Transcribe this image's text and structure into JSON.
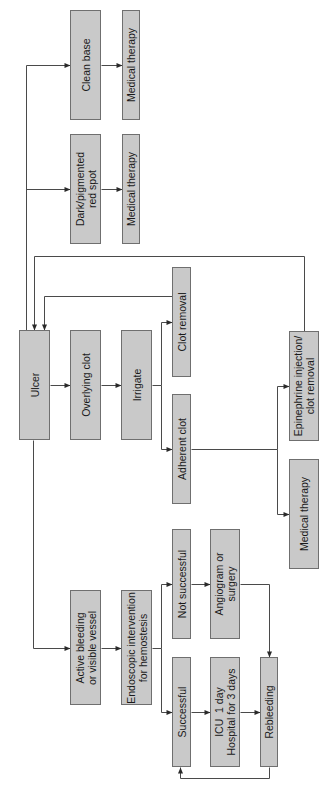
{
  "diagram": {
    "orientation": "rotated-90-ccw",
    "colors": {
      "box_fill": "#c9c9c9",
      "box_border": "#6f6f6f",
      "line": "#4a4a4a",
      "background": "#ffffff"
    },
    "nodes": [
      {
        "id": "clean_base",
        "label": "Clean base",
        "x": 70,
        "y": 10,
        "w": 31,
        "h": 110
      },
      {
        "id": "med_therapy_1",
        "label": "Medical therapy",
        "x": 122,
        "y": 10,
        "w": 18,
        "h": 110
      },
      {
        "id": "dark_spot",
        "label": "Dark/pigmented\nred spot",
        "x": 70,
        "y": 134,
        "w": 31,
        "h": 110
      },
      {
        "id": "med_therapy_2",
        "label": "Medical therapy",
        "x": 122,
        "y": 134,
        "w": 18,
        "h": 110
      },
      {
        "id": "ulcer",
        "label": "Ulcer",
        "x": 19,
        "y": 330,
        "w": 31,
        "h": 110
      },
      {
        "id": "overlying_clot",
        "label": "Overlying clot",
        "x": 70,
        "y": 330,
        "w": 31,
        "h": 110
      },
      {
        "id": "irrigate",
        "label": "Irrigate",
        "x": 121,
        "y": 330,
        "w": 31,
        "h": 110
      },
      {
        "id": "clot_removal",
        "label": "Clot removal",
        "x": 172,
        "y": 267,
        "w": 19,
        "h": 110
      },
      {
        "id": "adherent_clot",
        "label": "Adherent clot",
        "x": 172,
        "y": 394,
        "w": 19,
        "h": 110
      },
      {
        "id": "epinephrine",
        "label": "Epinephrine injection/\nclot removal",
        "x": 289,
        "y": 331,
        "w": 30,
        "h": 110
      },
      {
        "id": "med_therapy_3",
        "label": "Medical therapy",
        "x": 289,
        "y": 459,
        "w": 30,
        "h": 110
      },
      {
        "id": "active_bleeding",
        "label": "Active bleeding\nor visible vessel",
        "x": 70,
        "y": 590,
        "w": 31,
        "h": 115
      },
      {
        "id": "endoscopic",
        "label": "Endoscopic intervention\nfor hemostesis",
        "x": 121,
        "y": 590,
        "w": 31,
        "h": 115
      },
      {
        "id": "not_successful",
        "label": "Not successful",
        "x": 172,
        "y": 529,
        "w": 19,
        "h": 110
      },
      {
        "id": "angiogram",
        "label": "Angiogram or\nsurgery",
        "x": 210,
        "y": 529,
        "w": 30,
        "h": 110
      },
      {
        "id": "successful",
        "label": "Successful",
        "x": 172,
        "y": 657,
        "w": 19,
        "h": 110
      },
      {
        "id": "icu",
        "label": "ICU  1 day\nHospital for 3 days",
        "x": 210,
        "y": 657,
        "w": 30,
        "h": 110
      },
      {
        "id": "rebleeding",
        "label": "Rebleeding",
        "x": 260,
        "y": 657,
        "w": 18,
        "h": 110
      }
    ],
    "edges": [
      {
        "from": "ulcer",
        "to": "clean_base",
        "points": [
          [
            26,
            330
          ],
          [
            26,
            65
          ],
          [
            70,
            65
          ]
        ]
      },
      {
        "from": "ulcer",
        "to": "dark_spot",
        "points": [
          [
            26,
            189
          ],
          [
            70,
            189
          ]
        ]
      },
      {
        "from": "clean_base",
        "to": "med_therapy_1",
        "points": [
          [
            101,
            65
          ],
          [
            122,
            65
          ]
        ]
      },
      {
        "from": "dark_spot",
        "to": "med_therapy_2",
        "points": [
          [
            101,
            189
          ],
          [
            122,
            189
          ]
        ]
      },
      {
        "from": "ulcer",
        "to": "overlying_clot",
        "points": [
          [
            50,
            385
          ],
          [
            70,
            385
          ]
        ]
      },
      {
        "from": "overlying_clot",
        "to": "irrigate",
        "points": [
          [
            101,
            385
          ],
          [
            121,
            385
          ]
        ]
      },
      {
        "from": "irrigate",
        "to": "clot_removal",
        "points": [
          [
            152,
            385
          ],
          [
            161,
            385
          ],
          [
            161,
            322
          ],
          [
            172,
            322
          ]
        ]
      },
      {
        "from": "irrigate",
        "to": "adherent_clot",
        "points": [
          [
            161,
            385
          ],
          [
            161,
            449
          ],
          [
            172,
            449
          ]
        ]
      },
      {
        "from": "clot_removal",
        "to": "ulcer",
        "points": [
          [
            172,
            296
          ],
          [
            44,
            296
          ],
          [
            44,
            330
          ]
        ]
      },
      {
        "from": "adherent_clot",
        "to": "epinephrine",
        "points": [
          [
            191,
            449
          ],
          [
            277,
            449
          ],
          [
            277,
            386
          ],
          [
            289,
            386
          ]
        ]
      },
      {
        "from": "adherent_clot",
        "to": "med_therapy_3",
        "points": [
          [
            277,
            449
          ],
          [
            277,
            514
          ],
          [
            289,
            514
          ]
        ]
      },
      {
        "from": "epinephrine",
        "to": "ulcer",
        "points": [
          [
            304,
            331
          ],
          [
            304,
            256
          ],
          [
            34,
            256
          ],
          [
            34,
            330
          ]
        ]
      },
      {
        "from": "ulcer",
        "to": "active_bleeding",
        "points": [
          [
            33,
            440
          ],
          [
            33,
            648
          ],
          [
            70,
            648
          ]
        ]
      },
      {
        "from": "active_bleeding",
        "to": "endoscopic",
        "points": [
          [
            101,
            648
          ],
          [
            121,
            648
          ]
        ]
      },
      {
        "from": "endoscopic",
        "to": "not_successful",
        "points": [
          [
            152,
            648
          ],
          [
            161,
            648
          ],
          [
            161,
            584
          ],
          [
            172,
            584
          ]
        ]
      },
      {
        "from": "endoscopic",
        "to": "successful",
        "points": [
          [
            161,
            648
          ],
          [
            161,
            712
          ],
          [
            172,
            712
          ]
        ]
      },
      {
        "from": "not_successful",
        "to": "angiogram",
        "points": [
          [
            191,
            584
          ],
          [
            210,
            584
          ]
        ]
      },
      {
        "from": "successful",
        "to": "icu",
        "points": [
          [
            191,
            712
          ],
          [
            210,
            712
          ]
        ]
      },
      {
        "from": "icu",
        "to": "rebleeding",
        "points": [
          [
            240,
            712
          ],
          [
            260,
            712
          ]
        ]
      },
      {
        "from": "angiogram",
        "to": "rebleeding",
        "points": [
          [
            240,
            584
          ],
          [
            269,
            584
          ],
          [
            269,
            657
          ]
        ]
      },
      {
        "from": "rebleeding",
        "to": "successful",
        "points": [
          [
            269,
            767
          ],
          [
            269,
            778
          ],
          [
            180,
            778
          ],
          [
            180,
            767
          ]
        ]
      }
    ]
  }
}
